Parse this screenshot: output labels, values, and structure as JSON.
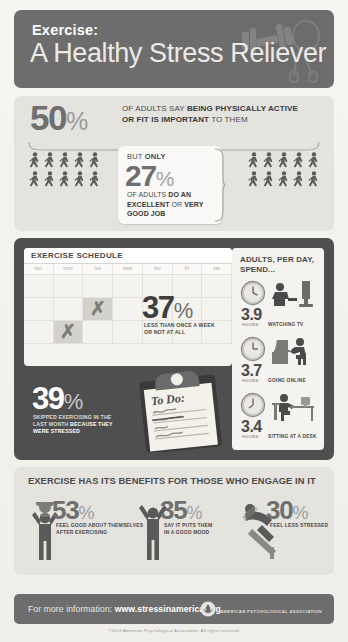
{
  "header": {
    "title_line1": "Exercise:",
    "title_line2": "A Healthy Stress Reliever",
    "icons": [
      "dumbbell-icon",
      "jump-rope-icon"
    ]
  },
  "panel_awareness": {
    "stat_primary": {
      "value": "50",
      "percent": "%",
      "text_line1_plain": "OF ADULTS SAY ",
      "text_line1_bold": "BEING PHYSICALLY ACTIVE",
      "text_line2_bold": "OR FIT IS IMPORTANT",
      "text_line2_plain": " TO THEM"
    },
    "stat_callout": {
      "eyebrow_plain": "BUT ",
      "eyebrow_bold": "ONLY",
      "value": "27",
      "percent": "%",
      "sub_plain_1": "OF ADULTS ",
      "sub_bold_1": "DO AN",
      "sub_bold_2": "EXCELLENT",
      "sub_plain_2": " OR ",
      "sub_bold_3": "VERY",
      "sub_bold_4": "GOOD JOB"
    },
    "figure_icon": "walking-person-icon",
    "figures_left_count": 10,
    "figures_right_count": 10
  },
  "panel_schedule": {
    "calendar": {
      "title": "EXERCISE SCHEDULE",
      "day_headers": [
        "sun",
        "mon",
        "tue",
        "wed",
        "thu",
        "fri",
        "sat"
      ],
      "marked_cells": [
        9,
        22
      ],
      "mark_glyph": "x-mark-icon"
    },
    "stat_frequency": {
      "value": "37",
      "percent": "%",
      "label_line1": "LESS THAN ONCE A WEEK",
      "label_line2": "OR NOT AT ALL"
    },
    "stat_skipped": {
      "value": "39",
      "percent": "%",
      "label_line1": "SKIPPED EXERCISING IN THE",
      "label_line2_plain": "LAST MONTH ",
      "label_line2_bold": "BECAUSE THEY",
      "label_line3_bold": "WERE STRESSED"
    },
    "clipboard": {
      "heading": "To Do:",
      "items": [
        "",
        "exercise",
        "",
        "",
        ""
      ],
      "struck_item": "exercise",
      "icon": "clipboard-icon"
    },
    "sedentary": {
      "title_line1": "ADULTS, PER DAY,",
      "title_line2": "SPEND...",
      "unit_label": "HOURS",
      "rows": [
        {
          "hours": "3.9",
          "activity": "WATCHING TV",
          "icon": "tv-watching-icon",
          "clock_icon": "clock-icon"
        },
        {
          "hours": "3.7",
          "activity": "GOING ONLINE",
          "icon": "laptop-user-icon",
          "clock_icon": "clock-icon"
        },
        {
          "hours": "3.4",
          "activity": "SITTING AT A DESK",
          "icon": "desk-sitting-icon",
          "clock_icon": "clock-icon"
        }
      ]
    }
  },
  "panel_benefits": {
    "title": "EXERCISE HAS ITS BENEFITS FOR THOSE WHO ENGAGE IN IT",
    "items": [
      {
        "value": "53",
        "percent": "%",
        "label_line1": "FEEL GOOD ABOUT THEMSELVES",
        "label_line2": "AFTER EXERCISING",
        "icon": "person-trophy-icon"
      },
      {
        "value": "35",
        "percent": "%",
        "label_line1": "SAY IT PUTS THEM",
        "label_line2": "IN A GOOD MOOD",
        "icon": "person-arms-up-icon"
      },
      {
        "value": "30",
        "percent": "%",
        "label_line1": "FEEL LESS STRESSED",
        "label_line2": "",
        "icon": "person-lounging-icon"
      }
    ]
  },
  "footer": {
    "info_plain": "For more information: ",
    "info_url": "www.stressinamerica.org",
    "org_name": "AMERICAN PSYCHOLOGICAL ASSOCIATION",
    "org_logo_icon": "apa-logo-icon",
    "copyright": "©2014 American Psychological Association. All rights reserved."
  },
  "colors": {
    "dark_bar": "#6d6d6d",
    "mid_panel": "#4f4f4f",
    "light_panel": "#e4e3de",
    "paper": "#f4f3ef",
    "number_gray": "#6f6f6f"
  }
}
